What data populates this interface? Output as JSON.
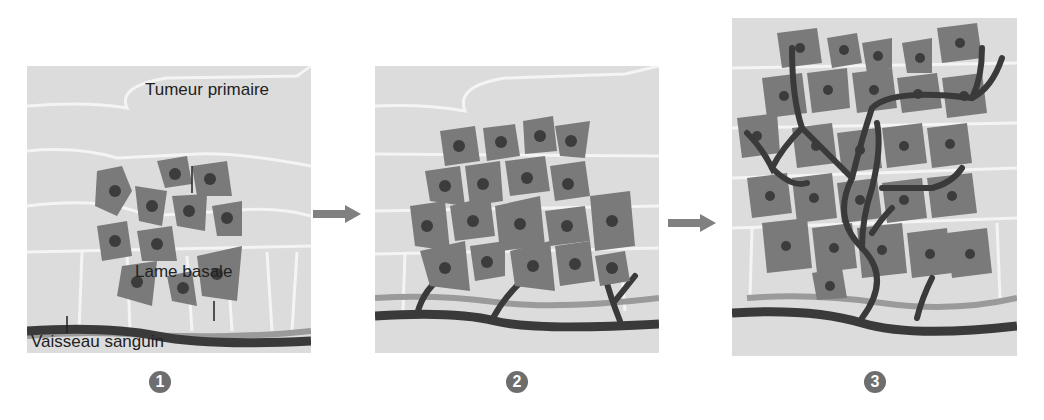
{
  "diagram": {
    "type": "tumor-angiogenesis-stages",
    "panels": [
      {
        "number": "1",
        "stage": "tumeur-primaire"
      },
      {
        "number": "2",
        "stage": "angiogenese-initiale"
      },
      {
        "number": "3",
        "stage": "vascularisation-tumorale"
      }
    ],
    "labels": {
      "tumor": "Tumeur primaire",
      "basal_lamina": "Lame basale",
      "blood_vessel": "Vaisseau sanguin"
    },
    "colors": {
      "tissue": "#dcdcdc",
      "cell_outline": "#f4f4f4",
      "tumor_cell": "#7a7a7a",
      "nucleus": "#3c3c3c",
      "vessel": "#3a3a3a",
      "basal_lamina": "#9a9a9a",
      "arrow": "#808080",
      "badge": "#6e6e6e"
    }
  }
}
